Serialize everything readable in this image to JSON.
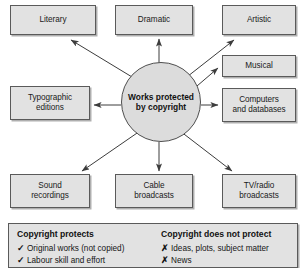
{
  "diagram": {
    "center": {
      "name": "center-node",
      "lines": [
        "Works",
        "protected by",
        "copyright"
      ],
      "text": "Works protected by copyright",
      "shape": "ellipse",
      "fill": "#dcdcdc",
      "stroke": "#4f4f4f"
    },
    "box_fill": "#e2e2e2",
    "box_stroke": "#5a5a5a",
    "arrow_color": "#3c3c3c",
    "nodes": [
      {
        "id": "literary",
        "lines": [
          "Literary"
        ],
        "text": "Literary",
        "x": 10,
        "y": 5,
        "w": 86,
        "h": 30
      },
      {
        "id": "dramatic",
        "lines": [
          "Dramatic"
        ],
        "text": "Dramatic",
        "x": 115,
        "y": 5,
        "w": 78,
        "h": 30
      },
      {
        "id": "artistic",
        "lines": [
          "Artistic"
        ],
        "text": "Artistic",
        "x": 222,
        "y": 5,
        "w": 74,
        "h": 30
      },
      {
        "id": "musical",
        "lines": [
          "Musical"
        ],
        "text": "Musical",
        "x": 222,
        "y": 55,
        "w": 74,
        "h": 22
      },
      {
        "id": "computers-and-databases",
        "lines": [
          "Computers",
          "and databases"
        ],
        "text": "Computers and databases",
        "x": 222,
        "y": 88,
        "w": 74,
        "h": 34
      },
      {
        "id": "typographic-editions",
        "lines": [
          "Typographic",
          "editions"
        ],
        "text": "Typographic editions",
        "x": 10,
        "y": 86,
        "w": 80,
        "h": 34
      },
      {
        "id": "sound-recordings",
        "lines": [
          "Sound",
          "recordings"
        ],
        "text": "Sound recordings",
        "x": 10,
        "y": 174,
        "w": 80,
        "h": 34
      },
      {
        "id": "cable-broadcasts",
        "lines": [
          "Cable",
          "broadcasts"
        ],
        "text": "Cable broadcasts",
        "x": 115,
        "y": 174,
        "w": 78,
        "h": 34
      },
      {
        "id": "tv-radio-broadcasts",
        "lines": [
          "TV/radio",
          "broadcasts"
        ],
        "text": "TV/radio broadcasts",
        "x": 222,
        "y": 174,
        "w": 74,
        "h": 34
      }
    ]
  },
  "legend": {
    "protects": {
      "title": "Copyright protects",
      "mark": "✓",
      "items": [
        "Original works (not copied)",
        "Labour skill and effort"
      ]
    },
    "not_protects": {
      "title": "Copyright does not protect",
      "mark": "✗",
      "items": [
        "Ideas, plots, subject matter",
        "News"
      ]
    }
  }
}
